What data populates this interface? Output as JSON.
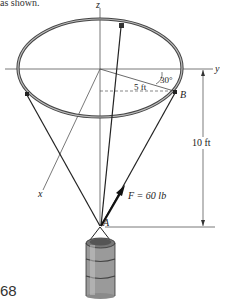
{
  "caption_fragment": "as shown.",
  "page_number": "68",
  "axes": {
    "z": "z",
    "y": "y",
    "x": "x"
  },
  "labels": {
    "angle": "30°",
    "radius": "5 ft",
    "point_b": "B",
    "point_a": "A",
    "height": "10 ft",
    "force": "F = 60 lb"
  },
  "problem": {
    "ring_radius_ft": 5,
    "height_ft": 10,
    "angle_deg": 30,
    "force_lb": 60
  }
}
